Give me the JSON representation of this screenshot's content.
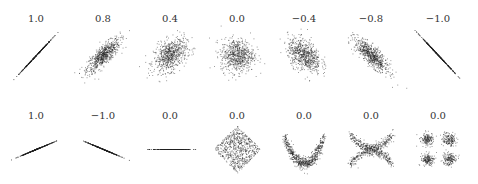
{
  "chart_data": {
    "type": "scatter",
    "title": "",
    "panels": [
      {
        "row": 1,
        "label": "1.0",
        "correlation": 1.0,
        "shape": "perfect-line",
        "slope_dir": "positive-steep"
      },
      {
        "row": 1,
        "label": "0.8",
        "correlation": 0.8,
        "shape": "gaussian-cloud"
      },
      {
        "row": 1,
        "label": "0.4",
        "correlation": 0.4,
        "shape": "gaussian-cloud"
      },
      {
        "row": 1,
        "label": "0.0",
        "correlation": 0.0,
        "shape": "gaussian-cloud"
      },
      {
        "row": 1,
        "label": "−0.4",
        "correlation": -0.4,
        "shape": "gaussian-cloud"
      },
      {
        "row": 1,
        "label": "−0.8",
        "correlation": -0.8,
        "shape": "gaussian-cloud"
      },
      {
        "row": 1,
        "label": "−1.0",
        "correlation": -1.0,
        "shape": "perfect-line",
        "slope_dir": "negative-steep"
      },
      {
        "row": 2,
        "label": "1.0",
        "correlation": 1.0,
        "shape": "perfect-line",
        "slope_dir": "positive-shallow"
      },
      {
        "row": 2,
        "label": "−1.0",
        "correlation": -1.0,
        "shape": "perfect-line",
        "slope_dir": "negative-shallow"
      },
      {
        "row": 2,
        "label": "0.0",
        "correlation": 0.0,
        "shape": "perfect-line",
        "slope_dir": "flat"
      },
      {
        "row": 2,
        "label": "0.0",
        "correlation": 0.0,
        "shape": "diamond"
      },
      {
        "row": 2,
        "label": "0.0",
        "correlation": 0.0,
        "shape": "parabola"
      },
      {
        "row": 2,
        "label": "0.0",
        "correlation": 0.0,
        "shape": "x-curves"
      },
      {
        "row": 2,
        "label": "0.0",
        "correlation": 0.0,
        "shape": "four-clusters"
      }
    ],
    "grid": false,
    "legend": "none"
  },
  "colors": {
    "points": "#222222",
    "text": "#333333"
  }
}
